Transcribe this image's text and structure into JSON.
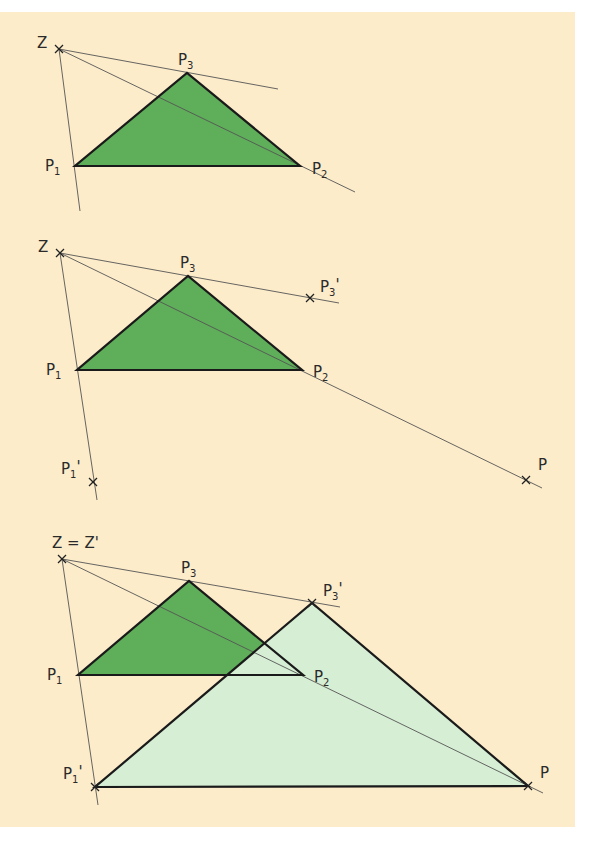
{
  "figure": {
    "background_color": "#fcecca",
    "original_fill": "#5fae5a",
    "image_fill": "#d6eed4",
    "edge_color": "#1a1a1a",
    "ray_color": "#555555"
  },
  "step1": {
    "labels": {
      "Z": "Z",
      "P1": "P",
      "P1_sub": "1",
      "P2": "P",
      "P2_sub": "2",
      "P3": "P",
      "P3_sub": "3"
    },
    "points": {
      "Z": [
        59,
        49
      ],
      "P1": [
        75,
        166
      ],
      "P2": [
        300,
        166
      ],
      "P3": [
        187,
        73
      ]
    }
  },
  "step2": {
    "labels": {
      "Z": "Z",
      "P1": "P",
      "P1_sub": "1",
      "P2": "P",
      "P2_sub": "2",
      "P3": "P",
      "P3_sub": "3",
      "P3p": "P",
      "P3p_sub": "3",
      "P3p_prime": "'",
      "P1p": "P",
      "P1p_sub": "1",
      "P1p_prime": "'",
      "P": "P"
    },
    "points": {
      "Z": [
        60,
        253
      ],
      "P1": [
        77,
        370
      ],
      "P2": [
        302,
        370
      ],
      "P3": [
        188,
        276
      ],
      "P3p": [
        310,
        298
      ],
      "P1p": [
        93,
        482
      ],
      "P": [
        526,
        480
      ]
    }
  },
  "step3": {
    "labels": {
      "Z": "Z = Z'",
      "P1": "P",
      "P1_sub": "1",
      "P2": "P",
      "P2_sub": "2",
      "P3": "P",
      "P3_sub": "3",
      "P3p": "P",
      "P3p_sub": "3",
      "P3p_prime": "'",
      "P1p": "P",
      "P1p_sub": "1",
      "P1p_prime": "'",
      "P": "P"
    },
    "points": {
      "Z": [
        62,
        559
      ],
      "P1": [
        78,
        675
      ],
      "P2": [
        303,
        675
      ],
      "P3": [
        189,
        581
      ],
      "P3p": [
        312,
        603
      ],
      "P1p": [
        95,
        787
      ],
      "P": [
        528,
        786
      ]
    }
  }
}
